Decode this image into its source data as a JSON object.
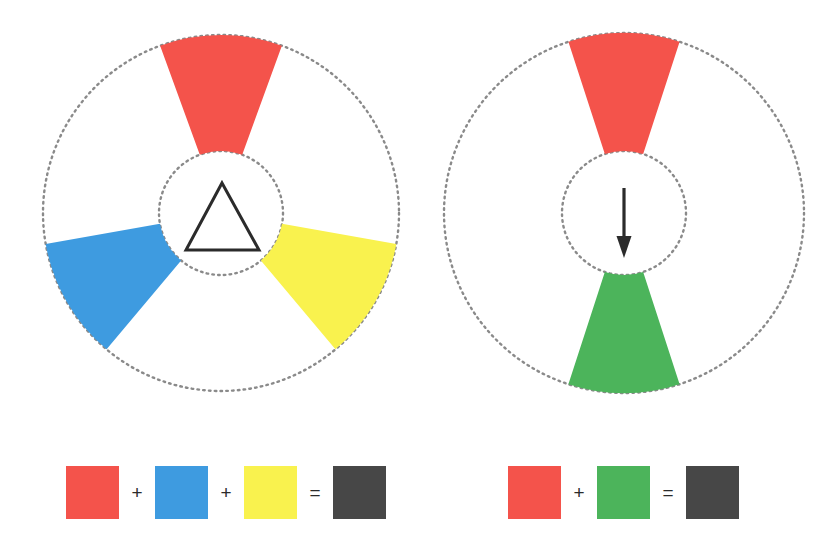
{
  "figure": {
    "background_color": "#ffffff",
    "width": 839,
    "height": 557
  },
  "palette": {
    "red": "#F4534B",
    "blue": "#3E9BE0",
    "yellow": "#F9F24E",
    "green": "#4CB45B",
    "dark_gray": "#474747",
    "outline": "#2b2b2b",
    "dotted_circle": "#8a8a8a"
  },
  "wheels": [
    {
      "id": "primary-triad-wheel",
      "name": "three-colour-wheel",
      "center_x": 221,
      "center_y": 213,
      "outer_radius": 178,
      "inner_radius": 62,
      "center_glyph": "triangle",
      "sectors": [
        {
          "name": "red-sector",
          "color_key": "red",
          "color": "#F4534B",
          "center_angle_deg": 0,
          "span_deg": 40
        },
        {
          "name": "blue-sector",
          "color_key": "blue",
          "color": "#3E9BE0",
          "center_angle_deg": 240,
          "span_deg": 40
        },
        {
          "name": "yellow-sector",
          "color_key": "yellow",
          "color": "#F9F24E",
          "center_angle_deg": 120,
          "span_deg": 40
        }
      ]
    },
    {
      "id": "complementary-pair-wheel",
      "name": "two-colour-wheel",
      "center_x": 624,
      "center_y": 213,
      "outer_radius": 180,
      "inner_radius": 62,
      "center_glyph": "down-arrow",
      "sectors": [
        {
          "name": "red-sector",
          "color_key": "red",
          "color": "#F4534B",
          "center_angle_deg": 0,
          "span_deg": 36
        },
        {
          "name": "green-sector",
          "color_key": "green",
          "color": "#4CB45B",
          "center_angle_deg": 180,
          "span_deg": 36
        }
      ]
    }
  ],
  "equations": [
    {
      "id": "triad-equation",
      "name": "three-colour-equation",
      "swatch_size": 53,
      "y": 466,
      "items": [
        {
          "type": "swatch",
          "name": "red-swatch",
          "color": "#F4534B",
          "x": 66,
          "label": "red"
        },
        {
          "type": "operator",
          "name": "plus-operator",
          "symbol": "+",
          "x": 137
        },
        {
          "type": "swatch",
          "name": "blue-swatch",
          "color": "#3E9BE0",
          "x": 155,
          "label": "blue"
        },
        {
          "type": "operator",
          "name": "plus-operator",
          "symbol": "+",
          "x": 226
        },
        {
          "type": "swatch",
          "name": "yellow-swatch",
          "color": "#F9F24E",
          "x": 244,
          "label": "yellow"
        },
        {
          "type": "operator",
          "name": "equals-operator",
          "symbol": "=",
          "x": 315
        },
        {
          "type": "swatch",
          "name": "dark-gray-swatch",
          "color": "#474747",
          "x": 333,
          "label": "dark gray"
        }
      ]
    },
    {
      "id": "pair-equation",
      "name": "two-colour-equation",
      "swatch_size": 53,
      "y": 466,
      "items": [
        {
          "type": "swatch",
          "name": "red-swatch",
          "color": "#F4534B",
          "x": 508,
          "label": "red"
        },
        {
          "type": "operator",
          "name": "plus-operator",
          "symbol": "+",
          "x": 579
        },
        {
          "type": "swatch",
          "name": "green-swatch",
          "color": "#4CB45B",
          "x": 597,
          "label": "green"
        },
        {
          "type": "operator",
          "name": "equals-operator",
          "symbol": "=",
          "x": 668
        },
        {
          "type": "swatch",
          "name": "dark-gray-swatch",
          "color": "#474747",
          "x": 686,
          "label": "dark gray"
        }
      ]
    }
  ],
  "center_glyphs": {
    "triangle": {
      "name": "triangle-outline-icon",
      "apex_x": 222,
      "apex_y": 183,
      "left_x": 186,
      "left_y": 250,
      "right_x": 259,
      "right_y": 250,
      "stroke": "#2b2b2b",
      "stroke_width": 3
    },
    "down_arrow": {
      "name": "down-arrow-icon",
      "x": 624,
      "y_start": 188,
      "y_end": 258,
      "stroke": "#2b2b2b",
      "stroke_width": 3.2,
      "head_width": 15,
      "head_length": 22
    }
  }
}
